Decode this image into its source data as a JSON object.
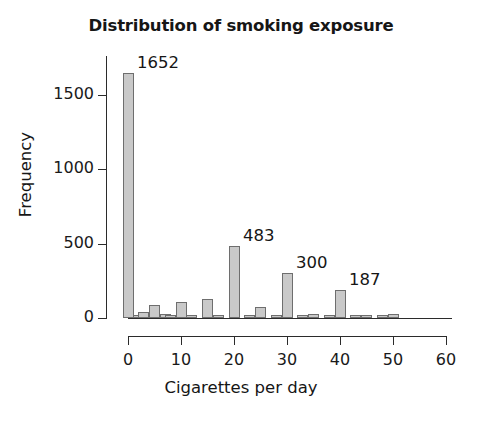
{
  "chart_data": {
    "type": "bar",
    "title": "Distribution of smoking exposure",
    "xlabel": "Cigarettes per day",
    "ylabel": "Frequency",
    "xlim": [
      0,
      60
    ],
    "ylim": [
      0,
      1750
    ],
    "grid": false,
    "legend": null,
    "x_ticks": [
      0,
      10,
      20,
      30,
      40,
      50,
      60
    ],
    "x_tick_labels": [
      "0",
      "10",
      "20",
      "30",
      "40",
      "50",
      "60"
    ],
    "y_ticks": [
      0,
      500,
      1000,
      1500
    ],
    "y_tick_labels": [
      "0",
      "500",
      "1000",
      "1500"
    ],
    "bar_color": "#c9c9c9",
    "bar_edge_color": "#6e6e6e",
    "x": [
      0,
      2,
      3,
      5,
      7,
      8,
      10,
      12,
      15,
      17,
      20,
      23,
      25,
      28,
      30,
      33,
      35,
      38,
      40,
      43,
      45,
      48,
      50
    ],
    "values": [
      1652,
      22,
      38,
      88,
      26,
      10,
      108,
      18,
      125,
      20,
      483,
      8,
      72,
      18,
      300,
      8,
      30,
      12,
      187,
      6,
      10,
      4,
      30
    ],
    "annotations": [
      {
        "label": "1652",
        "x": 0,
        "value": 1652
      },
      {
        "label": "483",
        "x": 20,
        "value": 483
      },
      {
        "label": "300",
        "x": 30,
        "value": 300
      },
      {
        "label": "187",
        "x": 40,
        "value": 187
      }
    ]
  }
}
